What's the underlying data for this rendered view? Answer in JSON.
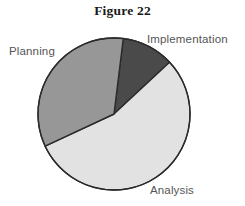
{
  "figure": {
    "title": "Figure 22"
  },
  "chart_data": {
    "type": "pie",
    "title": "Figure 22",
    "xlabel": "",
    "ylabel": "",
    "legend_position": "none",
    "grid": false,
    "categories": [
      "Implementation",
      "Analysis",
      "Planning"
    ],
    "values": [
      11,
      55,
      34
    ],
    "units": "percent",
    "total": 100,
    "start_angle_deg": 7,
    "direction": "clockwise",
    "slices": [
      {
        "label": "Implementation",
        "value": 11,
        "color": "#4a4a4a",
        "start_angle_deg": 7,
        "end_angle_deg": 47,
        "label_position": "outside-top-right"
      },
      {
        "label": "Analysis",
        "value": 55,
        "color": "#e2e2e2",
        "start_angle_deg": 47,
        "end_angle_deg": 245,
        "label_position": "outside-bottom-right"
      },
      {
        "label": "Planning",
        "value": 34,
        "color": "#979797",
        "start_angle_deg": 245,
        "end_angle_deg": 367,
        "label_position": "outside-top-left"
      }
    ],
    "geometry": {
      "center_x": 114,
      "center_y": 114,
      "radius": 76
    },
    "style": {
      "outline_color": "#2b2b2b",
      "outline_width": 1.4,
      "background": "#ffffff",
      "label_color": "#555555",
      "title_color": "#1a1a1a"
    }
  },
  "labels": {
    "implementation": "Implementation",
    "analysis": "Analysis",
    "planning": "Planning"
  }
}
